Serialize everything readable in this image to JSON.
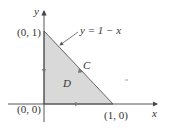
{
  "figure": {
    "axes": {
      "x_label": "x",
      "y_label": "y"
    },
    "points": {
      "top": "(0, 1)",
      "origin": "(0, 0)",
      "right": "(1, 0)"
    },
    "curve_label": "y = 1 − x",
    "region_label": "D",
    "boundary_label": "C",
    "colors": {
      "region_fill": "#d9d9d9",
      "stroke": "#555555",
      "axis": "#444444",
      "text": "#333333"
    }
  }
}
